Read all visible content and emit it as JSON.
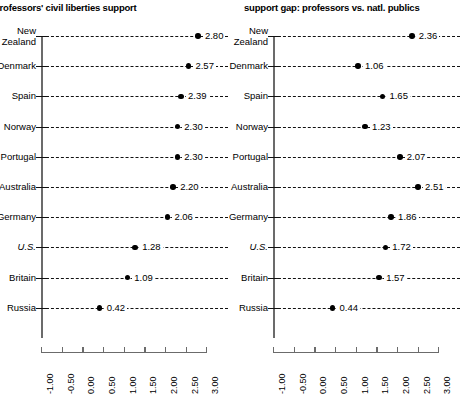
{
  "figure": {
    "panels": [
      {
        "id": "left",
        "title": "professors' civil liberties support",
        "title_truncated": true
      },
      {
        "id": "right",
        "title": "support gap: professors vs. natl. publics",
        "title_truncated": false
      }
    ],
    "categories": [
      "New Zealand",
      "Denmark",
      "Spain",
      "Norway",
      "Portugal",
      "Australia",
      "Germany",
      "U.S.",
      "Britain",
      "Russia"
    ],
    "highlight_category": "U.S.",
    "axis": {
      "ticks": [
        "-1.00",
        "-0.50",
        "0.00",
        "0.50",
        "1.00",
        "1.50",
        "2.00",
        "2.50",
        "3.00"
      ],
      "min": -1.0,
      "max": 3.0,
      "step": 0.5
    },
    "colors": {
      "dot": "#000000",
      "dash": "#111111",
      "axis": "#6b6b6b",
      "text": "#1a1a1a",
      "background": "#ffffff"
    }
  },
  "chart_data": {
    "type": "scatter",
    "xlabel": "",
    "ylabel": "",
    "xlim": [
      -1.0,
      3.0
    ],
    "grid": false,
    "legend": "none",
    "orientation": "horizontal-dot-plot",
    "categories": [
      "New Zealand",
      "Denmark",
      "Spain",
      "Norway",
      "Portugal",
      "Australia",
      "Germany",
      "U.S.",
      "Britain",
      "Russia"
    ],
    "series": [
      {
        "name": "professors' civil liberties support",
        "panel": "left",
        "values": [
          2.8,
          2.57,
          2.39,
          2.3,
          2.3,
          2.2,
          2.06,
          1.28,
          1.09,
          0.42
        ],
        "labels": [
          "2.80",
          "2.57",
          "2.39",
          "2.30",
          "2.30",
          "2.20",
          "2.06",
          "1.28",
          "1.09",
          "0.42"
        ]
      },
      {
        "name": "support gap: professors vs. natl. publics",
        "panel": "right",
        "values": [
          2.36,
          1.06,
          1.65,
          1.23,
          2.07,
          2.51,
          1.86,
          1.72,
          1.57,
          0.44
        ],
        "labels": [
          "2.36",
          "1.06",
          "1.65",
          "1.23",
          "2.07",
          "2.51",
          "1.86",
          "1.72",
          "1.57",
          "0.44"
        ]
      }
    ],
    "xticks": [
      -1.0,
      -0.5,
      0.0,
      0.5,
      1.0,
      1.5,
      2.0,
      2.5,
      3.0
    ],
    "xticklabels": [
      "-1.00",
      "-0.50",
      "0.00",
      "0.50",
      "1.00",
      "1.50",
      "2.00",
      "2.50",
      "3.00"
    ]
  }
}
